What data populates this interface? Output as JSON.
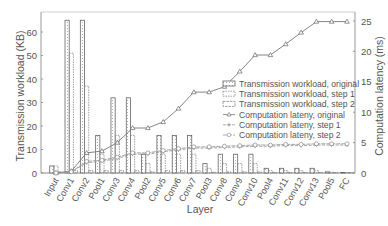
{
  "chart_data": {
    "type": "bar",
    "title": "",
    "xlabel": "Layer",
    "ylabel": "Transmission workload (KB)",
    "y2label": "Computation latency (ms)",
    "ylim": [
      0,
      68
    ],
    "y2lim": [
      0,
      27
    ],
    "yticks": [
      0,
      10,
      20,
      30,
      40,
      50,
      60
    ],
    "y2ticks": [
      0,
      5,
      10,
      15,
      20,
      25
    ],
    "grid": false,
    "legend_position": "center-right",
    "categories": [
      "Input",
      "Conv1",
      "Conv2",
      "Pool1",
      "Conv3",
      "Conv4",
      "Pool2",
      "Conv5",
      "Conv6",
      "Conv7",
      "Pool3",
      "Conv8",
      "Conv9",
      "Conv10",
      "Pool4",
      "Conv11",
      "Conv12",
      "Conv13",
      "Pool5",
      "FC"
    ],
    "series": [
      {
        "name": "Transmission workload, original",
        "axis": "left",
        "kind": "bar",
        "values": [
          3,
          65,
          65,
          16,
          32,
          32,
          8,
          16,
          16,
          16,
          4,
          8,
          8,
          8,
          2,
          2,
          2,
          2,
          0.5,
          0.1
        ]
      },
      {
        "name": "Transmission workload, step 1",
        "axis": "left",
        "kind": "bar",
        "values": [
          3,
          51,
          37,
          8,
          16,
          16,
          4,
          8,
          8,
          8,
          2,
          4,
          4,
          4,
          1,
          1,
          1,
          1,
          0.3,
          0.1
        ]
      },
      {
        "name": "Transmission workload, step 2",
        "axis": "left",
        "kind": "bar",
        "values": [
          0.5,
          1,
          1,
          1,
          1,
          1,
          0.5,
          1,
          1,
          1,
          0.3,
          0.5,
          0.5,
          0.5,
          0.2,
          0.2,
          0.2,
          0.2,
          0.1,
          0.1
        ]
      },
      {
        "name": "Computation lateny, original",
        "axis": "right",
        "kind": "line",
        "values": [
          0,
          0.3,
          3.3,
          3.6,
          5.0,
          7.4,
          7.4,
          8.4,
          10.6,
          13.3,
          13.3,
          14.2,
          16.7,
          19.4,
          19.4,
          21.2,
          23.1,
          24.9,
          24.9,
          24.9
        ]
      },
      {
        "name": "Computation lateny, step 1",
        "axis": "right",
        "kind": "line",
        "values": [
          0,
          0.2,
          1.7,
          1.9,
          2.4,
          3.1,
          3.1,
          3.5,
          3.8,
          4.1,
          4.1,
          4.2,
          4.3,
          4.4,
          4.4,
          4.5,
          4.5,
          4.6,
          4.6,
          4.6
        ]
      },
      {
        "name": "Computation lateny, step 2",
        "axis": "right",
        "kind": "line",
        "values": [
          0,
          0.2,
          1.9,
          2.1,
          2.6,
          3.3,
          3.3,
          3.7,
          4.0,
          4.3,
          4.3,
          4.4,
          4.5,
          4.6,
          4.6,
          4.7,
          4.7,
          4.8,
          4.8,
          4.8
        ]
      }
    ]
  }
}
